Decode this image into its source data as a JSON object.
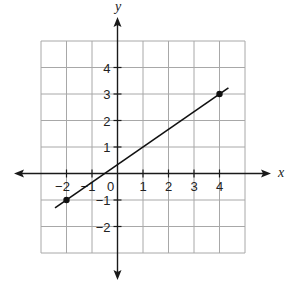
{
  "chart_data": {
    "type": "line",
    "title": "",
    "xlabel": "x",
    "ylabel": "y",
    "xlim": [
      -3,
      5
    ],
    "ylim": [
      -3,
      5
    ],
    "grid": true,
    "x_tick_labels": [
      "-2",
      "-1",
      "0",
      "1",
      "2",
      "3",
      "4"
    ],
    "y_tick_labels": [
      "4",
      "3",
      "2",
      "1",
      "-1",
      "-2"
    ],
    "series": [
      {
        "name": "line",
        "points": [
          {
            "x": -2,
            "y": -1
          },
          {
            "x": 4,
            "y": 3
          }
        ],
        "slope": 0.6667,
        "intercept": 0.3333,
        "extends_beyond_points": true
      }
    ],
    "marked_points": [
      {
        "x": -2,
        "y": -1
      },
      {
        "x": 4,
        "y": 3
      }
    ]
  },
  "colors": {
    "grid": "#a8a8a8",
    "axis": "#1a1a1a",
    "line": "#111111"
  }
}
